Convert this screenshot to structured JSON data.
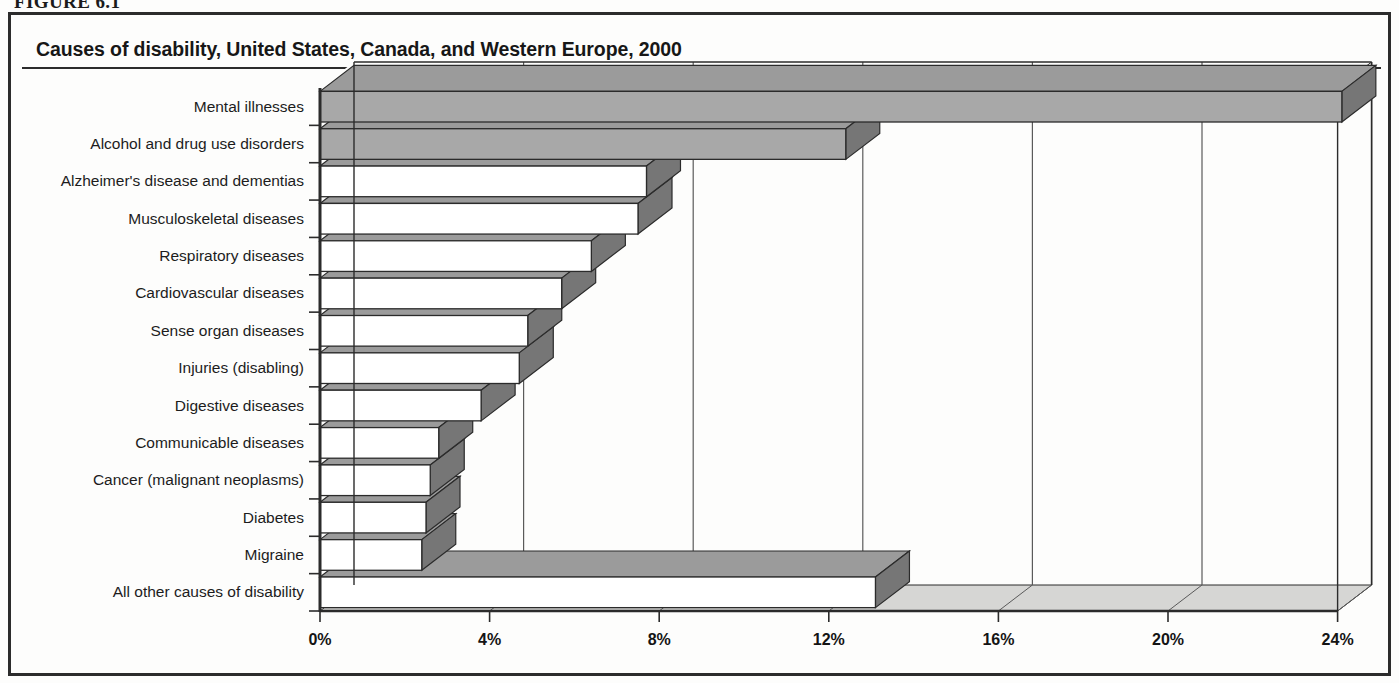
{
  "figure": {
    "number_label": "FIGURE 6.1"
  },
  "header": {
    "title": "Causes of disability, United States, Canada, and Western Europe, 2000"
  },
  "chart_data": {
    "type": "bar",
    "orientation": "horizontal",
    "title": "Causes of disability, United States, Canada, and Western Europe, 2000",
    "xlabel": "",
    "ylabel": "",
    "xlim": [
      0,
      24
    ],
    "xtick_labels": [
      "0%",
      "4%",
      "8%",
      "12%",
      "16%",
      "20%",
      "24%"
    ],
    "xticks": [
      0,
      4,
      8,
      12,
      16,
      20,
      24
    ],
    "grid": true,
    "grid_axis": "x",
    "legend": "none",
    "style_3d": true,
    "categories": [
      "Mental illnesses",
      "Alcohol and drug use disorders",
      "Alzheimer's disease and dementias",
      "Musculoskeletal diseases",
      "Respiratory diseases",
      "Cardiovascular diseases",
      "Sense organ diseases",
      "Injuries (disabling)",
      "Digestive diseases",
      "Communicable diseases",
      "Cancer (malignant neoplasms)",
      "Diabetes",
      "Migraine",
      "All other causes of disability"
    ],
    "values": [
      24.1,
      12.4,
      7.7,
      7.5,
      6.4,
      5.7,
      4.9,
      4.7,
      3.8,
      2.8,
      2.6,
      2.5,
      2.4,
      13.1
    ],
    "value_unit": "percent",
    "bar_fill_colors": [
      "#a8a8a8",
      "#a8a8a8",
      "#ffffff",
      "#ffffff",
      "#ffffff",
      "#ffffff",
      "#ffffff",
      "#ffffff",
      "#ffffff",
      "#ffffff",
      "#ffffff",
      "#ffffff",
      "#ffffff",
      "#ffffff"
    ],
    "bar_side_color": "#767676",
    "bar_top_color": "#9b9b9b",
    "bar_outline_color": "#2b2b2b",
    "axis_color": "#2b2b2b",
    "gridline_color": "#5a5a5a"
  },
  "colors": {
    "frame": "#2c2c2c",
    "text": "#1c1c1c",
    "page_background": "#fdfdfc"
  }
}
